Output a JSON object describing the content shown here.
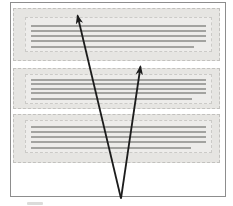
{
  "figure": {
    "type": "diagram",
    "canvas": {
      "width": 233,
      "height": 206,
      "background": "#ffffff"
    },
    "frame": {
      "x": 10,
      "y": 2,
      "width": 216,
      "height": 195,
      "border_color": "#8d8d8d"
    },
    "colors": {
      "block_fill": "#e6e5e2",
      "block_border": "#c2c1be",
      "inner_fill": "#edecea",
      "inner_border": "#cbcac7",
      "text_line": "#a3a3a0",
      "arrow": "#1c1c1c",
      "caption_remnant": "#dcdcda"
    },
    "blocks": [
      {
        "label": "text-block-1",
        "rect": {
          "x": 13,
          "y": 8,
          "width": 207,
          "height": 53
        },
        "inner": {
          "x": 25,
          "y": 17,
          "width": 187,
          "height": 35
        },
        "lines": [
          {
            "y": 24.5,
            "x1": 31,
            "x2": 206
          },
          {
            "y": 29.5,
            "x1": 31,
            "x2": 206
          },
          {
            "y": 34.5,
            "x1": 31,
            "x2": 206
          },
          {
            "y": 39.5,
            "x1": 31,
            "x2": 206
          },
          {
            "y": 45.5,
            "x1": 31,
            "x2": 194
          }
        ]
      },
      {
        "label": "text-block-2",
        "rect": {
          "x": 13,
          "y": 68,
          "width": 207,
          "height": 41
        },
        "inner": {
          "x": 25,
          "y": 74,
          "width": 187,
          "height": 30
        },
        "lines": [
          {
            "y": 78.5,
            "x1": 31,
            "x2": 206
          },
          {
            "y": 83,
            "x1": 31,
            "x2": 206
          },
          {
            "y": 87.5,
            "x1": 31,
            "x2": 206
          },
          {
            "y": 92,
            "x1": 31,
            "x2": 206
          },
          {
            "y": 97.5,
            "x1": 31,
            "x2": 192
          }
        ]
      },
      {
        "label": "text-block-3",
        "rect": {
          "x": 13,
          "y": 114,
          "width": 207,
          "height": 49
        },
        "inner": {
          "x": 25,
          "y": 120,
          "width": 187,
          "height": 33
        },
        "lines": [
          {
            "y": 125.5,
            "x1": 31,
            "x2": 206
          },
          {
            "y": 130.5,
            "x1": 31,
            "x2": 206
          },
          {
            "y": 135.5,
            "x1": 31,
            "x2": 206
          },
          {
            "y": 140.5,
            "x1": 31,
            "x2": 206
          },
          {
            "y": 147,
            "x1": 31,
            "x2": 191
          }
        ]
      }
    ],
    "arrows": [
      {
        "label": "arrow-to-block-1",
        "from": {
          "x": 121,
          "y": 198.5
        },
        "to": {
          "x": 77.5,
          "y": 15.5
        }
      },
      {
        "label": "arrow-to-block-2",
        "from": {
          "x": 121,
          "y": 198.5
        },
        "to": {
          "x": 140.5,
          "y": 66.5
        }
      }
    ],
    "caption_remnant": {
      "x": 27,
      "y": 202,
      "width": 16,
      "height": 2.5
    }
  }
}
